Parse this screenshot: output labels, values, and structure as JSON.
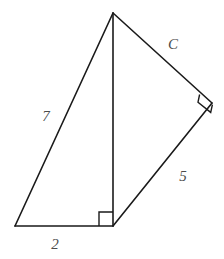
{
  "figure": {
    "background_color": "#ffffff",
    "stroke_color": "#1a1a1a",
    "label_color": "#4b4b4b",
    "stroke_width": 1.6,
    "vertices": {
      "apex": {
        "x": 113,
        "y": 13
      },
      "bottom_left": {
        "x": 15,
        "y": 226
      },
      "bottom_mid": {
        "x": 113,
        "y": 226
      },
      "right": {
        "x": 212,
        "y": 103
      }
    },
    "edges": [
      {
        "name": "edge-left-hypotenuse",
        "from": "apex",
        "to": "bottom_left",
        "label": "7"
      },
      {
        "name": "edge-bottom-base",
        "from": "bottom_left",
        "to": "bottom_mid",
        "label": "2"
      },
      {
        "name": "edge-vertical-shared",
        "from": "apex",
        "to": "bottom_mid",
        "label": ""
      },
      {
        "name": "edge-upper-right",
        "from": "apex",
        "to": "right",
        "label": "C"
      },
      {
        "name": "edge-lower-right",
        "from": "bottom_mid",
        "to": "right",
        "label": "5"
      }
    ],
    "right_angle_markers": [
      {
        "name": "right-angle-marker-bottom",
        "at": "bottom_mid",
        "size": 14
      },
      {
        "name": "right-angle-marker-right",
        "at": "right",
        "size": 11
      }
    ],
    "labels": {
      "side_7": {
        "text": "7",
        "x": 46,
        "y": 116
      },
      "side_2": {
        "text": "2",
        "x": 55,
        "y": 244
      },
      "side_5": {
        "text": "5",
        "x": 183,
        "y": 176
      },
      "side_c": {
        "text": "C",
        "x": 173,
        "y": 44
      }
    }
  }
}
